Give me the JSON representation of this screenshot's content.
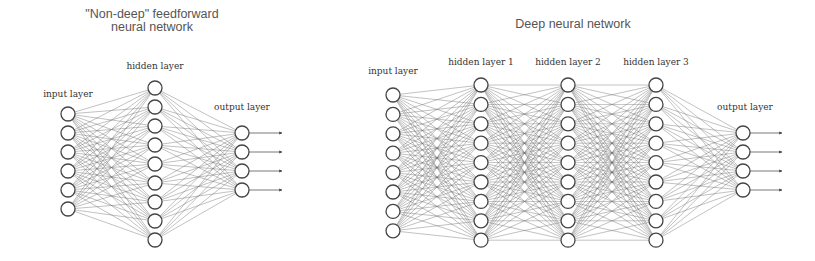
{
  "diagrams": [
    {
      "name": "shallow-network",
      "title_lines": [
        "\"Non-deep\" feedforward",
        "neural network"
      ],
      "title_x": 152,
      "title_y": [
        18,
        31
      ],
      "node_radius": 7,
      "layers": [
        {
          "label": "input layer",
          "label_x": 68,
          "label_y": 97,
          "x": 68,
          "count": 6,
          "y_start": 114,
          "y_step": 19
        },
        {
          "label": "hidden layer",
          "label_x": 155,
          "label_y": 69,
          "x": 155,
          "count": 9,
          "y_start": 88,
          "y_step": 19
        },
        {
          "label": "output layer",
          "label_x": 242,
          "label_y": 110,
          "x": 242,
          "count": 4,
          "y_start": 133,
          "y_step": 19
        }
      ],
      "output_arrow_end_x": 282
    },
    {
      "name": "deep-network",
      "title_lines": [
        "Deep neural network"
      ],
      "title_x": 573,
      "title_y": [
        28
      ],
      "node_radius": 7,
      "layers": [
        {
          "label": "input layer",
          "label_x": 393,
          "label_y": 74,
          "x": 393,
          "count": 8,
          "y_start": 95,
          "y_step": 19.4
        },
        {
          "label": "hidden layer 1",
          "label_x": 481,
          "label_y": 65,
          "x": 481,
          "count": 9,
          "y_start": 85,
          "y_step": 19.4
        },
        {
          "label": "hidden layer 2",
          "label_x": 568,
          "label_y": 65,
          "x": 568,
          "count": 9,
          "y_start": 85,
          "y_step": 19.4
        },
        {
          "label": "hidden layer 3",
          "label_x": 656,
          "label_y": 65,
          "x": 656,
          "count": 9,
          "y_start": 85,
          "y_step": 19.4
        },
        {
          "label": "output layer",
          "label_x": 745,
          "label_y": 110,
          "x": 743,
          "count": 4,
          "y_start": 133,
          "y_step": 19
        }
      ],
      "output_arrow_end_x": 782
    }
  ]
}
